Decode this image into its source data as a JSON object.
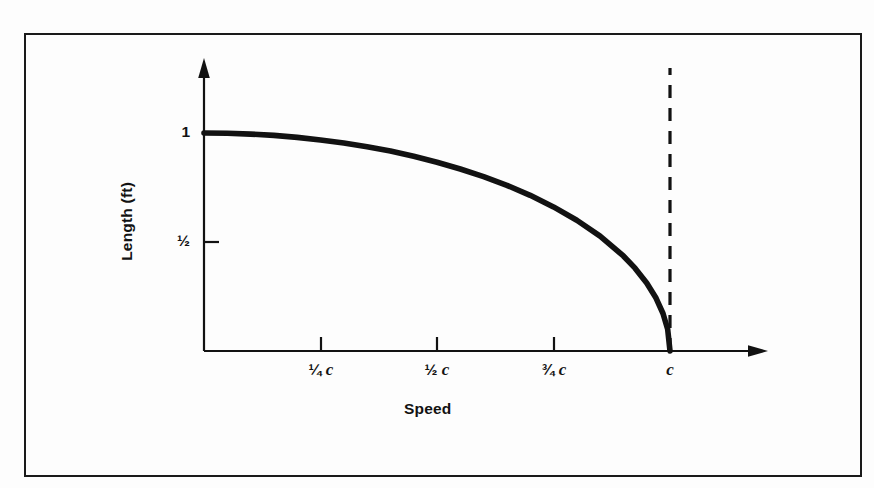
{
  "figure": {
    "background_color": "#fdfdfd",
    "frame_color": "#1a1a1a",
    "ink_color": "#121212"
  },
  "axes": {
    "ylabel": "Length (ft)",
    "xlabel": "Speed",
    "y_ticks": [
      {
        "label": "1",
        "value": 1
      },
      {
        "label": "½",
        "value": 0.5
      }
    ],
    "x_ticks": [
      {
        "frac": "¼",
        "sym": "c",
        "value": 0.25
      },
      {
        "frac": "½",
        "sym": "c",
        "value": 0.5
      },
      {
        "frac": "¾",
        "sym": "c",
        "value": 0.75
      },
      {
        "frac": "",
        "sym": "c",
        "value": 1.0
      }
    ]
  },
  "chart_data": {
    "type": "line",
    "title": "",
    "subtitle": "",
    "xlabel": "Speed",
    "ylabel": "Length (ft)",
    "xlim": [
      0,
      1.2
    ],
    "ylim": [
      0,
      1.18
    ],
    "grid": false,
    "legend": null,
    "x_tick_labels": [
      "¼ c",
      "½ c",
      "¾ c",
      "c"
    ],
    "x_tick_values": [
      0.25,
      0.5,
      0.75,
      1.0
    ],
    "y_tick_labels": [
      "1",
      "½"
    ],
    "y_tick_values": [
      1.0,
      0.5
    ],
    "series": [
      {
        "name": "Lorentz contraction",
        "formula": "L = L0 * sqrt(1 - (v/c)^2)",
        "x": [
          0.0,
          0.05,
          0.1,
          0.15,
          0.2,
          0.25,
          0.3,
          0.35,
          0.4,
          0.45,
          0.5,
          0.55,
          0.6,
          0.65,
          0.7,
          0.75,
          0.8,
          0.85,
          0.9,
          0.925,
          0.95,
          0.97,
          0.985,
          0.995,
          1.0
        ],
        "y": [
          1.0,
          0.999,
          0.995,
          0.989,
          0.98,
          0.968,
          0.954,
          0.937,
          0.917,
          0.893,
          0.866,
          0.835,
          0.8,
          0.76,
          0.714,
          0.661,
          0.6,
          0.527,
          0.436,
          0.38,
          0.312,
          0.243,
          0.172,
          0.0999,
          0.0
        ]
      }
    ],
    "annotations": [
      {
        "kind": "vertical-dashed-line",
        "name": "speed-of-light-asymptote",
        "x": 1.0,
        "y_from": 0.0,
        "y_to": 1.3,
        "label": "c"
      }
    ],
    "axis_style": "arrow-ended open axes"
  }
}
